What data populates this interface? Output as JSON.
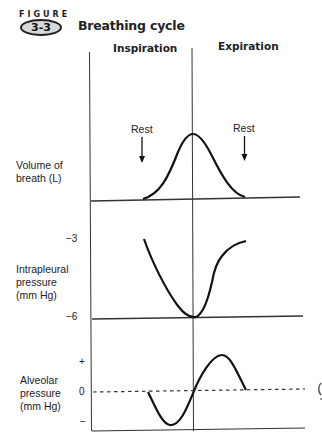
{
  "figure": {
    "label": "FIGURE",
    "number": "3-3",
    "title": "Breathing cycle"
  },
  "phases": {
    "inspiration": "Inspiration",
    "expiration": "Expiration"
  },
  "annotations": {
    "rest_left": "Rest",
    "rest_right": "Rest"
  },
  "panels": [
    {
      "id": "volume",
      "label_lines": [
        "Volume of",
        "breath (L)"
      ],
      "ticks": []
    },
    {
      "id": "intrapleural",
      "label_lines": [
        "Intrapleural",
        "pressure",
        "(mm Hg)"
      ],
      "ticks": [
        "−3",
        "−6"
      ]
    },
    {
      "id": "alveolar",
      "label_lines": [
        "Alveolar",
        "pressure",
        "(mm Hg)"
      ],
      "ticks": [
        "+",
        "0",
        "−"
      ]
    }
  ],
  "colors": {
    "ink": "#111111",
    "badge_fill": "#d8d8d8",
    "background": "#ffffff"
  }
}
